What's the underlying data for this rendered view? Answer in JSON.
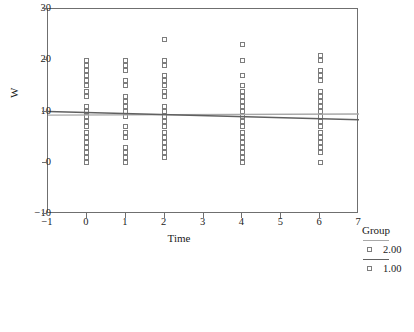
{
  "chart_data": {
    "type": "scatter",
    "title": "",
    "xlabel": "Time",
    "ylabel": "W",
    "xlim": [
      -1,
      7
    ],
    "ylim": [
      -10,
      30
    ],
    "xticks": [
      -1,
      0,
      1,
      2,
      3,
      4,
      5,
      6,
      7
    ],
    "xticklabels": [
      "−1",
      "0",
      "1",
      "2",
      "3",
      "4",
      "5",
      "6",
      "7"
    ],
    "yticks": [
      -10,
      0,
      10,
      20,
      30
    ],
    "yticklabels": [
      "−10",
      "0",
      "10",
      "20",
      "30"
    ],
    "grid": false,
    "legend": {
      "title": "Group",
      "position": "right",
      "entries": [
        {
          "label": "2.00",
          "line_color": "#a8a8a8",
          "marker": "open-square"
        },
        {
          "label": "1.00",
          "line_color": "#606060",
          "marker": "open-square"
        }
      ]
    },
    "marker_style": "open-square",
    "series": [
      {
        "name": "2.00",
        "points": [
          {
            "x": 0,
            "y": 20
          },
          {
            "x": 0,
            "y": 19
          },
          {
            "x": 0,
            "y": 18
          },
          {
            "x": 0,
            "y": 17
          },
          {
            "x": 0,
            "y": 16
          },
          {
            "x": 0,
            "y": 15
          },
          {
            "x": 0,
            "y": 14
          },
          {
            "x": 0,
            "y": 13
          },
          {
            "x": 0,
            "y": 11
          },
          {
            "x": 0,
            "y": 10
          },
          {
            "x": 0,
            "y": 9
          },
          {
            "x": 0,
            "y": 8
          },
          {
            "x": 0,
            "y": 7
          },
          {
            "x": 0,
            "y": 6
          },
          {
            "x": 0,
            "y": 5
          },
          {
            "x": 0,
            "y": 4
          },
          {
            "x": 0,
            "y": 3
          },
          {
            "x": 0,
            "y": 2
          },
          {
            "x": 0,
            "y": 1
          },
          {
            "x": 0,
            "y": 0
          },
          {
            "x": 1,
            "y": 20
          },
          {
            "x": 1,
            "y": 19
          },
          {
            "x": 1,
            "y": 18
          },
          {
            "x": 1,
            "y": 16
          },
          {
            "x": 1,
            "y": 15
          },
          {
            "x": 1,
            "y": 13
          },
          {
            "x": 1,
            "y": 12
          },
          {
            "x": 1,
            "y": 11
          },
          {
            "x": 1,
            "y": 10
          },
          {
            "x": 1,
            "y": 9
          },
          {
            "x": 1,
            "y": 7
          },
          {
            "x": 1,
            "y": 6
          },
          {
            "x": 1,
            "y": 5
          },
          {
            "x": 1,
            "y": 3
          },
          {
            "x": 1,
            "y": 2
          },
          {
            "x": 1,
            "y": 1
          },
          {
            "x": 1,
            "y": 0
          },
          {
            "x": 2,
            "y": 24
          },
          {
            "x": 2,
            "y": 20
          },
          {
            "x": 2,
            "y": 19
          },
          {
            "x": 2,
            "y": 17
          },
          {
            "x": 2,
            "y": 16
          },
          {
            "x": 2,
            "y": 15
          },
          {
            "x": 2,
            "y": 14
          },
          {
            "x": 2,
            "y": 13
          },
          {
            "x": 2,
            "y": 11
          },
          {
            "x": 2,
            "y": 10
          },
          {
            "x": 2,
            "y": 9
          },
          {
            "x": 2,
            "y": 8
          },
          {
            "x": 2,
            "y": 7
          },
          {
            "x": 2,
            "y": 6
          },
          {
            "x": 2,
            "y": 5
          },
          {
            "x": 2,
            "y": 4
          },
          {
            "x": 2,
            "y": 3
          },
          {
            "x": 2,
            "y": 2
          },
          {
            "x": 2,
            "y": 1
          },
          {
            "x": 4,
            "y": 23
          },
          {
            "x": 4,
            "y": 20
          },
          {
            "x": 4,
            "y": 17
          },
          {
            "x": 4,
            "y": 15
          },
          {
            "x": 4,
            "y": 14
          },
          {
            "x": 4,
            "y": 13
          },
          {
            "x": 4,
            "y": 12
          },
          {
            "x": 4,
            "y": 11
          },
          {
            "x": 4,
            "y": 10
          },
          {
            "x": 4,
            "y": 9
          },
          {
            "x": 4,
            "y": 8
          },
          {
            "x": 4,
            "y": 7
          },
          {
            "x": 4,
            "y": 6
          },
          {
            "x": 4,
            "y": 5
          },
          {
            "x": 4,
            "y": 4
          },
          {
            "x": 4,
            "y": 3
          },
          {
            "x": 4,
            "y": 2
          },
          {
            "x": 4,
            "y": 1
          },
          {
            "x": 4,
            "y": 0
          },
          {
            "x": 6,
            "y": 21
          },
          {
            "x": 6,
            "y": 20
          },
          {
            "x": 6,
            "y": 18
          },
          {
            "x": 6,
            "y": 17
          },
          {
            "x": 6,
            "y": 16
          },
          {
            "x": 6,
            "y": 14
          },
          {
            "x": 6,
            "y": 13
          },
          {
            "x": 6,
            "y": 12
          },
          {
            "x": 6,
            "y": 11
          },
          {
            "x": 6,
            "y": 10
          },
          {
            "x": 6,
            "y": 9
          },
          {
            "x": 6,
            "y": 8
          },
          {
            "x": 6,
            "y": 7
          },
          {
            "x": 6,
            "y": 6
          },
          {
            "x": 6,
            "y": 5
          },
          {
            "x": 6,
            "y": 4
          },
          {
            "x": 6,
            "y": 3
          },
          {
            "x": 6,
            "y": 2
          },
          {
            "x": 6,
            "y": 0
          }
        ]
      }
    ],
    "fit_lines": [
      {
        "name": "2.00",
        "x0": -1,
        "y0": 9.3,
        "x1": 7,
        "y1": 9.5,
        "color": "#a8a8a8"
      },
      {
        "name": "1.00",
        "x0": -1,
        "y0": 10.0,
        "x1": 7,
        "y1": 8.4,
        "color": "#606060"
      }
    ]
  }
}
